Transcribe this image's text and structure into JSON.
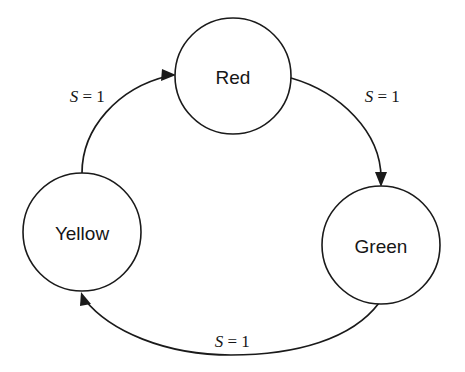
{
  "diagram": {
    "kind": "state-transition-diagram",
    "background_color": "#ffffff",
    "stroke_color": "#1a1a1a",
    "text_color": "#161616",
    "states": [
      {
        "id": "red",
        "label": "Red",
        "cx": 233,
        "cy": 76,
        "r": 58
      },
      {
        "id": "yellow",
        "label": "Yellow",
        "cx": 82,
        "cy": 232,
        "r": 59
      },
      {
        "id": "green",
        "label": "Green",
        "cx": 381,
        "cy": 245,
        "r": 59
      }
    ],
    "transitions": [
      {
        "id": "yellow-to-red",
        "from": "yellow",
        "to": "red",
        "condition_var": "S",
        "condition_rest": " = 1",
        "label": "S = 1",
        "label_x": 83,
        "label_y": 96
      },
      {
        "id": "red-to-green",
        "from": "red",
        "to": "green",
        "condition_var": "S",
        "condition_rest": " = 1",
        "label": "S = 1",
        "label_x": 378,
        "label_y": 96
      },
      {
        "id": "green-to-yellow",
        "from": "green",
        "to": "yellow",
        "condition_var": "S",
        "condition_rest": " = 1",
        "label": "S = 1",
        "label_x": 228,
        "label_y": 341
      }
    ]
  }
}
